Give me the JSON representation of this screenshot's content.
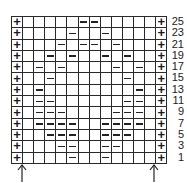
{
  "chart": {
    "columns": 14,
    "edge_symbol": "+",
    "stitch_symbol": "–",
    "rows": [
      {
        "label": "25",
        "dashes": [
          6,
          7
        ]
      },
      {
        "label": "23",
        "dashes": [
          5,
          8
        ]
      },
      {
        "label": "21",
        "dashes": [
          4,
          6,
          7,
          9
        ]
      },
      {
        "label": "19",
        "dashes": [
          3,
          5,
          8,
          10
        ]
      },
      {
        "label": "17",
        "dashes": [
          2,
          4,
          9,
          11
        ]
      },
      {
        "label": "15",
        "dashes": [
          3,
          10
        ]
      },
      {
        "label": "13",
        "dashes": [
          2,
          11
        ]
      },
      {
        "label": "11",
        "dashes": [
          2,
          3,
          10,
          11
        ]
      },
      {
        "label": "9",
        "dashes": [
          2,
          3,
          4,
          9,
          10,
          11
        ]
      },
      {
        "label": "7",
        "dashes": [
          2,
          3,
          4,
          5,
          8,
          9,
          10,
          11
        ]
      },
      {
        "label": "5",
        "dashes": [
          3,
          4,
          5,
          8,
          9,
          10
        ]
      },
      {
        "label": "3",
        "dashes": [
          4,
          5,
          8,
          9
        ]
      },
      {
        "label": "1",
        "dashes": [
          5,
          8
        ]
      }
    ],
    "arrows": [
      {
        "name": "left-arrow-icon",
        "x": 17
      },
      {
        "name": "right-arrow-icon",
        "x": 149
      }
    ]
  },
  "colors": {
    "line": "#2a2a2a",
    "background": "#ffffff"
  }
}
